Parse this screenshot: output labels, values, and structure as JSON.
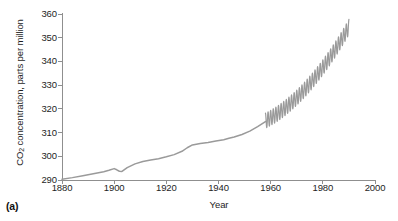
{
  "figure": {
    "panel_label": "(a)",
    "line_color": "#9a9a9a",
    "axis_color": "#8f8f8f",
    "text_color": "#1e1e1e",
    "background": "#ffffff"
  },
  "chart_data": {
    "type": "line",
    "title": "",
    "subtitle": "",
    "xlabel": "Year",
    "ylabel": "CO2 concentration, parts per million",
    "ylabel_html": "CO<sub>2</sub> concentration, parts per million",
    "xlim": [
      1880,
      2000
    ],
    "ylim": [
      290,
      360
    ],
    "xticks": [
      1880,
      1900,
      1920,
      1940,
      1960,
      1980,
      2000
    ],
    "yticks": [
      290,
      300,
      310,
      320,
      330,
      340,
      350,
      360
    ],
    "xtick_labels": [
      "1880",
      "1900",
      "1920",
      "1940",
      "1960",
      "1980",
      "2000"
    ],
    "ytick_labels": [
      "290",
      "300",
      "310",
      "320",
      "330",
      "340",
      "350",
      "360"
    ],
    "grid": false,
    "legend": false,
    "legend_position": "none",
    "spines": [
      "left",
      "bottom"
    ],
    "tick_direction": "out",
    "annotations": [],
    "series": [
      {
        "name": "Ice-core record",
        "color": "#9a9a9a",
        "type": "line",
        "x": [
          1880,
          1884,
          1888,
          1892,
          1896,
          1898,
          1900,
          1901,
          1902,
          1903,
          1905,
          1908,
          1911,
          1914,
          1917,
          1920,
          1923,
          1926,
          1928,
          1930,
          1933,
          1936,
          1939,
          1942,
          1944,
          1946,
          1949,
          1952,
          1955,
          1958
        ],
        "y": [
          290.3,
          291.0,
          291.8,
          292.6,
          293.5,
          294.1,
          294.8,
          294.3,
          293.7,
          293.6,
          295.2,
          296.8,
          297.8,
          298.4,
          299.0,
          299.8,
          300.7,
          302.1,
          303.6,
          304.8,
          305.4,
          305.8,
          306.4,
          307.0,
          307.6,
          308.1,
          309.2,
          310.6,
          312.5,
          314.6
        ]
      },
      {
        "name": "Mauna Loa record (with seasonal cycle)",
        "color": "#9a9a9a",
        "type": "line-oscillating",
        "x_start": 1958,
        "x_end": 1990,
        "y_start": 315.0,
        "y_end": 354.5,
        "seasonal_amplitude_ppm": 3.2,
        "cycles_per_year": 1,
        "y_peak_visible": 357.0
      }
    ]
  }
}
